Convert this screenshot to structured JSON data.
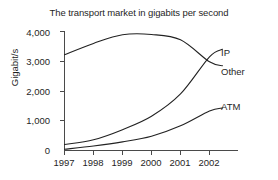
{
  "chart_data": {
    "type": "line",
    "title": "The transport market in gigabits per second",
    "xlabel": "",
    "ylabel": "Gigabit/s",
    "categories": [
      "1997",
      "1998",
      "1999",
      "2000",
      "2001",
      "2002"
    ],
    "x": [
      1997,
      1998,
      1999,
      2000,
      2001,
      2002
    ],
    "xlim": [
      1996.75,
      2002.5
    ],
    "ylim": [
      0,
      4000
    ],
    "yticks": [
      0,
      1000,
      2000,
      3000,
      4000
    ],
    "ytick_labels": [
      "0",
      "1,000",
      "2,000",
      "3,000",
      "4,000"
    ],
    "xtick_labels": [
      "1997",
      "1998",
      "1999",
      "2000",
      "2001",
      "2002"
    ],
    "grid": false,
    "legend_position": "right-inline-labels",
    "series": [
      {
        "name": "Other",
        "values": [
          3220,
          3600,
          3890,
          3900,
          3720,
          2980
        ],
        "end_value": 2850
      },
      {
        "name": "IP",
        "values": [
          200,
          360,
          700,
          1150,
          1900,
          3150
        ],
        "end_value": 3400
      },
      {
        "name": "ATM",
        "values": [
          40,
          150,
          290,
          480,
          830,
          1330
        ],
        "end_value": 1430
      }
    ],
    "annotations": [
      {
        "text": "IP",
        "series": "IP"
      },
      {
        "text": "Other",
        "series": "Other"
      },
      {
        "text": "ATM",
        "series": "ATM"
      }
    ]
  }
}
